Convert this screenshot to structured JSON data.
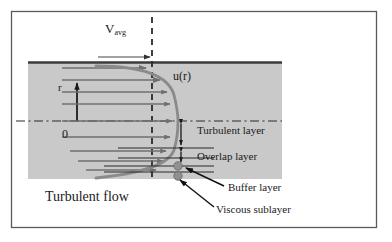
{
  "figure": {
    "title_text": "Turbulent flow velocity profile with near-wall layers",
    "labels": {
      "v_avg": "V",
      "v_avg_sub": "avg",
      "u_of_r": "u(r)",
      "radial_axis": "r",
      "origin": "0",
      "turbulent_layer": "Turbulent layer",
      "overlap_layer": "Overlap layer",
      "buffer_layer": "Buffer layer",
      "viscous_sublayer": "Viscous sublayer",
      "turbulent_flow": "Turbulent flow"
    },
    "colors": {
      "frame": "#555555",
      "pipe_fill": "#c9c9c9",
      "wall_line": "#3b3b3b",
      "profile_curve": "#8a8a8a",
      "velocity_arrow": "#6f6f6f",
      "annotation": "#1a1a1a",
      "node_dot": "#909090",
      "background": "#ffffff"
    },
    "geometry": {
      "frame": {
        "x": 11,
        "y": 11,
        "width": 366,
        "height": 217
      },
      "pipe_region": {
        "x": 28,
        "y": 62,
        "width": 254,
        "height": 117
      },
      "wall_y": 62,
      "centerline_y": 121,
      "dashed_vavg_line_x": 152,
      "profile_wall_x": 178,
      "velocity_arrow_count": 9
    },
    "velocity_arrows": [
      {
        "y": 68,
        "x_start": 62,
        "x_end": 152
      },
      {
        "y": 80,
        "x_start": 62,
        "x_end": 165
      },
      {
        "y": 92,
        "x_start": 62,
        "x_end": 172
      },
      {
        "y": 104,
        "x_start": 62,
        "x_end": 175
      },
      {
        "y": 121,
        "x_start": 62,
        "x_end": 177
      },
      {
        "y": 137,
        "x_start": 62,
        "x_end": 175
      },
      {
        "y": 151,
        "x_start": 70,
        "x_end": 172
      },
      {
        "y": 161,
        "x_start": 78,
        "x_end": 168
      },
      {
        "y": 170,
        "x_start": 86,
        "x_end": 160
      }
    ],
    "layer_markers": [
      {
        "name": "turbulent-layer",
        "y_top": 121,
        "y_bottom": 148
      },
      {
        "name": "overlap-layer",
        "y_top": 150,
        "y_bottom": 163
      }
    ],
    "node_dots": [
      {
        "name": "buffer-layer-node",
        "cx": 178,
        "cy": 166,
        "r": 4
      },
      {
        "name": "viscous-sublayer-node",
        "cx": 178,
        "cy": 176,
        "r": 4
      }
    ],
    "leader_lines": [
      {
        "name": "buffer-layer-leader",
        "x1": 224,
        "y1": 186,
        "x2": 186,
        "y2": 168
      },
      {
        "name": "viscous-sublayer-leader",
        "x1": 214,
        "y1": 207,
        "x2": 180,
        "y2": 180
      }
    ]
  }
}
